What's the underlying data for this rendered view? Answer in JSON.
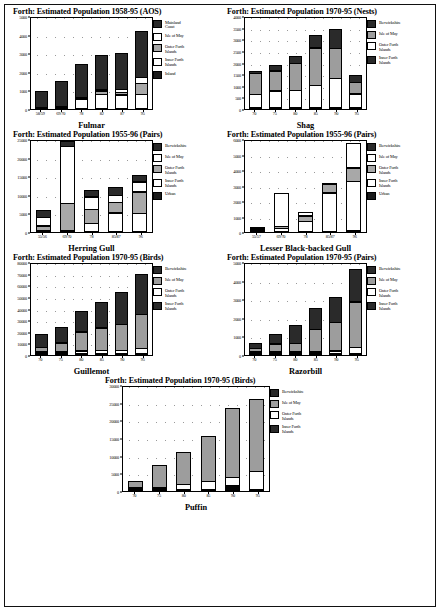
{
  "page": {
    "background": "#ffffff",
    "border_color": "#111111"
  },
  "series_colors": {
    "Mainland Coast": "#1b1b1b",
    "Berwickshire": "#1b1b1b",
    "Isle of May": "#ffffff",
    "Isle of May Grey": "#9d9d9d",
    "Outer Forth Islands": "#9d9d9d",
    "Outer Forth Islands White": "#ffffff",
    "Inner Forth Islands": "#ffffff",
    "Inner Forth Islands Dark": "#1b1b1b",
    "Inland": "#1b1b1b",
    "Urban": "#1b1b1b"
  },
  "charts": [
    {
      "id": "fulmar",
      "title": "Forth:  Estimated Population 1958-95 (AOS)",
      "category_label": "Fulmar",
      "chart_data": {
        "type": "bar",
        "stacked": true,
        "title": "Forth:  Estimated Population 1958-95 (AOS)",
        "xlabel": "Fulmar",
        "ylabel": "",
        "ylim": [
          0,
          5000
        ],
        "yticks": [
          0,
          1000,
          2000,
          3000,
          4000,
          5000
        ],
        "ytick_labels": [
          "0",
          "1000",
          "2000",
          "3000",
          "4000",
          "5000"
        ],
        "grid": true,
        "legend_position": "right",
        "categories": [
          "58/59",
          "69/70",
          "78",
          "82",
          "87",
          "95"
        ],
        "series": [
          {
            "name": "Inland",
            "fill": "f-dark",
            "values": [
              0,
              0,
              0,
              0,
              0,
              0
            ]
          },
          {
            "name": "Inner Forth Islands",
            "fill": "f-white",
            "values": [
              50,
              130,
              520,
              790,
              760,
              790
            ]
          },
          {
            "name": "Outer Forth Islands",
            "fill": "f-stip",
            "values": [
              0,
              0,
              130,
              190,
              170,
              620
            ]
          },
          {
            "name": "Isle of May",
            "fill": "f-white",
            "values": [
              0,
              0,
              0,
              130,
              200,
              380
            ]
          },
          {
            "name": "Mainland Coast",
            "fill": "f-dense",
            "values": [
              890,
              1400,
              1830,
              1890,
              1970,
              2490
            ]
          }
        ]
      },
      "legend": [
        {
          "label": "Mainland\nCoast",
          "fill": "f-dense"
        },
        {
          "label": "Isle of May",
          "fill": "f-white"
        },
        {
          "label": "Outer Forth\nIslands",
          "fill": "f-stip"
        },
        {
          "label": "Inner Forth\nIslands",
          "fill": "f-white"
        },
        {
          "label": "Inland",
          "fill": "f-dark"
        }
      ]
    },
    {
      "id": "shag",
      "title": "Forth:  Estimated Population 1970-95 (Nests)",
      "category_label": "Shag",
      "chart_data": {
        "type": "bar",
        "stacked": true,
        "title": "Forth:  Estimated Population 1970-95 (Nests)",
        "xlabel": "Shag",
        "ylabel": "",
        "ylim": [
          0,
          4000
        ],
        "yticks": [
          0,
          500,
          1000,
          1500,
          2000,
          2500,
          3000,
          3500,
          4000
        ],
        "ytick_labels": [
          "0",
          "500",
          "1000",
          "1500",
          "2000",
          "2500",
          "3000",
          "3500",
          "4000"
        ],
        "grid": true,
        "legend_position": "right",
        "categories": [
          "70",
          "75",
          "80",
          "85",
          "90",
          "95"
        ],
        "series": [
          {
            "name": "Inner Forth Islands",
            "fill": "f-black",
            "values": [
              40,
              40,
              50,
              60,
              60,
              40
            ]
          },
          {
            "name": "Outer Forth Islands",
            "fill": "f-white",
            "values": [
              570,
              730,
              750,
              960,
              1260,
              590
            ]
          },
          {
            "name": "Isle of May",
            "fill": "f-grey",
            "values": [
              930,
              880,
              1180,
              1640,
              1310,
              520
            ]
          },
          {
            "name": "Berwickshire",
            "fill": "f-dense",
            "values": [
              110,
              290,
              340,
              560,
              870,
              360
            ]
          }
        ]
      },
      "legend": [
        {
          "label": "Berwickshire",
          "fill": "f-dense"
        },
        {
          "label": "Isle of May",
          "fill": "f-grey"
        },
        {
          "label": "Outer Forth\nIslands",
          "fill": "f-white"
        },
        {
          "label": "Inner Forth\nIslands",
          "fill": "f-dense"
        }
      ]
    },
    {
      "id": "herring-gull",
      "title": "Forth:  Estimated Population 1955-96 (Pairs)",
      "category_label": "Herring Gull",
      "chart_data": {
        "type": "bar",
        "stacked": true,
        "title": "Forth:  Estimated Population 1955-96 (Pairs)",
        "xlabel": "Herring Gull",
        "ylabel": "",
        "ylim": [
          0,
          25000
        ],
        "yticks": [
          0,
          5000,
          10000,
          15000,
          20000,
          25000
        ],
        "ytick_labels": [
          "0",
          "5000",
          "10000",
          "15000",
          "20000",
          "25000"
        ],
        "grid": true,
        "legend_position": "right",
        "categories": [
          "55/56",
          "69/70",
          "78",
          "85/87",
          "96"
        ],
        "series": [
          {
            "name": "Urban",
            "fill": "f-black",
            "values": [
              0,
              0,
              0,
              0,
              0
            ]
          },
          {
            "name": "Inner Forth Islands",
            "fill": "f-white",
            "values": [
              300,
              400,
              2400,
              5200,
              5100
            ]
          },
          {
            "name": "Outer Forth Islands",
            "fill": "f-stip",
            "values": [
              1300,
              7400,
              3900,
              2900,
              5900
            ]
          },
          {
            "name": "Isle of May",
            "fill": "f-white",
            "values": [
              2400,
              15400,
              3500,
              2100,
              2800
            ]
          },
          {
            "name": "Berwickshire",
            "fill": "f-dense",
            "values": [
              2200,
              1700,
              2000,
              2500,
              1900
            ]
          }
        ]
      },
      "legend": [
        {
          "label": "Berwickshire",
          "fill": "f-dense"
        },
        {
          "label": "Isle of May",
          "fill": "f-white"
        },
        {
          "label": "Outer Forth\nIslands",
          "fill": "f-stip"
        },
        {
          "label": "Inner Forth\nIslands",
          "fill": "f-white"
        },
        {
          "label": "Urban",
          "fill": "f-dark"
        }
      ]
    },
    {
      "id": "lesser-black-backed-gull",
      "title": "Forth:  Estimated Population 1955-96 (Pairs)",
      "category_label": "Lesser Black-backed Gull",
      "chart_data": {
        "type": "bar",
        "stacked": true,
        "title": "Forth:  Estimated Population 1955-96 (Pairs)",
        "xlabel": "Lesser Black-backed Gull",
        "ylabel": "",
        "ylim": [
          0,
          6000
        ],
        "yticks": [
          0,
          1000,
          2000,
          3000,
          4000,
          5000,
          6000
        ],
        "ytick_labels": [
          "0",
          "1000",
          "2000",
          "3000",
          "4000",
          "5000",
          "6000"
        ],
        "grid": true,
        "legend_position": "right",
        "categories": [
          "55/57",
          "69/70",
          "78",
          "85/87",
          "96"
        ],
        "series": [
          {
            "name": "Urban",
            "fill": "f-black",
            "values": [
              0,
              0,
              0,
              0,
              90
            ]
          },
          {
            "name": "Inner Forth Islands",
            "fill": "f-white",
            "values": [
              110,
              250,
              700,
              2530,
              3180
            ]
          },
          {
            "name": "Outer Forth Islands",
            "fill": "f-stip",
            "values": [
              40,
              180,
              380,
              610,
              910
            ]
          },
          {
            "name": "Isle of May",
            "fill": "f-white",
            "values": [
              30,
              2140,
              310,
              60,
              1670
            ]
          },
          {
            "name": "Berwickshire",
            "fill": "f-dense",
            "values": [
              0,
              0,
              0,
              0,
              0
            ]
          }
        ]
      },
      "legend": [
        {
          "label": "Berwickshire",
          "fill": "f-dense"
        },
        {
          "label": "Isle of May",
          "fill": "f-white"
        },
        {
          "label": "Outer Forth\nIslands",
          "fill": "f-stip"
        },
        {
          "label": "Inner Forth\nIslands",
          "fill": "f-white"
        },
        {
          "label": "Urban",
          "fill": "f-dark"
        }
      ]
    },
    {
      "id": "guillemot",
      "title": "Forth:  Estimated Population 1970-95 (Birds)",
      "category_label": "Guillemot",
      "chart_data": {
        "type": "bar",
        "stacked": true,
        "title": "Forth:  Estimated Population 1970-95 (Birds)",
        "xlabel": "Guillemot",
        "ylabel": "",
        "ylim": [
          0,
          80000
        ],
        "yticks": [
          0,
          10000,
          20000,
          30000,
          40000,
          50000,
          60000,
          70000,
          80000
        ],
        "ytick_labels": [
          "0",
          "10000",
          "20000",
          "30000",
          "40000",
          "50000",
          "60000",
          "70000",
          "80000"
        ],
        "grid": true,
        "legend_position": "right",
        "categories": [
          "70",
          "75",
          "80",
          "85",
          "90",
          "95"
        ],
        "series": [
          {
            "name": "Inner Forth Islands",
            "fill": "f-black",
            "values": [
              300,
              400,
              500,
              600,
              700,
              800
            ]
          },
          {
            "name": "Outer Forth Islands",
            "fill": "f-white",
            "values": [
              1200,
              1500,
              2500,
              2700,
              3000,
              4500
            ]
          },
          {
            "name": "Isle of May",
            "fill": "f-grey",
            "values": [
              4200,
              8300,
              17000,
              20000,
              23000,
              30000
            ]
          },
          {
            "name": "Berwickshire",
            "fill": "f-dense",
            "values": [
              12300,
              13800,
              18000,
              22700,
              28300,
              34700
            ]
          }
        ]
      },
      "legend": [
        {
          "label": "Berwickshire",
          "fill": "f-dense"
        },
        {
          "label": "Isle of May",
          "fill": "f-grey"
        },
        {
          "label": "Outer Forth\nIslands",
          "fill": "f-white"
        },
        {
          "label": "Inner Forth\nIslands",
          "fill": "f-dense"
        }
      ]
    },
    {
      "id": "razorbill",
      "title": "Forth:  Estimated Population 1970-95 (Pairs)",
      "category_label": "Razorbill",
      "chart_data": {
        "type": "bar",
        "stacked": true,
        "title": "Forth:  Estimated Population 1970-95 (Pairs)",
        "xlabel": "Razorbill",
        "ylabel": "",
        "ylim": [
          0,
          5000
        ],
        "yticks": [
          0,
          1000,
          2000,
          3000,
          4000,
          5000
        ],
        "ytick_labels": [
          "0",
          "1000",
          "2000",
          "3000",
          "4000",
          "5000"
        ],
        "grid": true,
        "legend_position": "right",
        "categories": [
          "70",
          "75",
          "80",
          "85",
          "90",
          "95"
        ],
        "series": [
          {
            "name": "Inner Forth Islands",
            "fill": "f-black",
            "values": [
              20,
              30,
              40,
              50,
              60,
              70
            ]
          },
          {
            "name": "Outer Forth Islands",
            "fill": "f-white",
            "values": [
              40,
              60,
              90,
              110,
              150,
              330
            ]
          },
          {
            "name": "Isle of May",
            "fill": "f-grey",
            "values": [
              200,
              450,
              480,
              1240,
              1580,
              2490
            ]
          },
          {
            "name": "Berwickshire",
            "fill": "f-dense",
            "values": [
              350,
              570,
              990,
              1150,
              1370,
              1820
            ]
          }
        ]
      },
      "legend": [
        {
          "label": "Berwickshire",
          "fill": "f-dense"
        },
        {
          "label": "Isle of May",
          "fill": "f-grey"
        },
        {
          "label": "Outer Forth\nIslands",
          "fill": "f-white"
        },
        {
          "label": "Inner Forth\nIslands",
          "fill": "f-dense"
        }
      ]
    },
    {
      "id": "puffin",
      "title": "Forth:  Estimated Population 1970-95 (Birds)",
      "category_label": "Puffin",
      "chart_data": {
        "type": "bar",
        "stacked": true,
        "title": "Forth:  Estimated Population 1970-95 (Birds)",
        "xlabel": "Puffin",
        "ylabel": "",
        "ylim": [
          0,
          30000
        ],
        "yticks": [
          0,
          5000,
          10000,
          15000,
          20000,
          25000,
          30000
        ],
        "ytick_labels": [
          "0",
          "5000",
          "10000",
          "15000",
          "20000",
          "25000",
          "30000"
        ],
        "grid": true,
        "legend_position": "right",
        "categories": [
          "70",
          "75",
          "80",
          "85",
          "90",
          "95"
        ],
        "series": [
          {
            "name": "Inner Forth Islands",
            "fill": "f-black",
            "values": [
              120,
              350,
              330,
              350,
              1700,
              450
            ]
          },
          {
            "name": "Outer Forth Islands",
            "fill": "f-white",
            "values": [
              220,
              500,
              1600,
              2400,
              2400,
              5200
            ]
          },
          {
            "name": "Isle of May",
            "fill": "f-grey",
            "values": [
              2000,
              6700,
              9300,
              13000,
              19600,
              20600
            ]
          },
          {
            "name": "Berwickshire",
            "fill": "f-dense",
            "values": [
              0,
              0,
              0,
              0,
              0,
              0
            ]
          }
        ]
      },
      "legend": [
        {
          "label": "Berwickshire",
          "fill": "f-dense"
        },
        {
          "label": "Isle of May",
          "fill": "f-grey"
        },
        {
          "label": "Outer Forth\nIslands",
          "fill": "f-white"
        },
        {
          "label": "Inner Forth\nIslands",
          "fill": "f-dense"
        }
      ]
    }
  ]
}
